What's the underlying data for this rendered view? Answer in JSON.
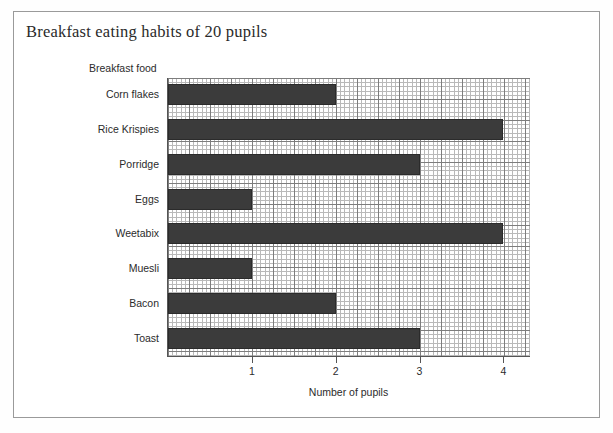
{
  "chart_data": {
    "type": "bar",
    "orientation": "horizontal",
    "title": "Breakfast eating habits of 20 pupils",
    "xlabel": "Number of pupils",
    "ylabel": "Breakfast food",
    "categories": [
      "Corn flakes",
      "Rice Krispies",
      "Porridge",
      "Eggs",
      "Weetabix",
      "Muesli",
      "Bacon",
      "Toast"
    ],
    "values": [
      2,
      4,
      3,
      1,
      4,
      1,
      2,
      3
    ],
    "xticks": [
      1,
      2,
      3,
      4
    ],
    "xticklabels": [
      "1",
      "2",
      "3",
      "4"
    ],
    "xlim": [
      0,
      4.33
    ],
    "grid": true,
    "grid_style": "graph-paper",
    "legend": null,
    "bar_color": "#3b3b3b",
    "grid_color": "#b9b9b9",
    "grid_major_color": "#7d7d7d",
    "axis_color": "#555555",
    "frame_color": "#9a9a9a",
    "background": "#ffffff"
  }
}
